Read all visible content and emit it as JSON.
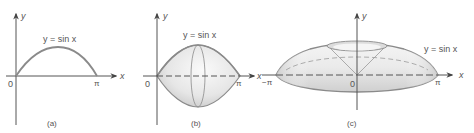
{
  "figure": {
    "panels": [
      {
        "id": "a",
        "caption": "(a)",
        "curve_label": "y = sin x",
        "axis_x_label": "x",
        "axis_y_label": "y",
        "origin_label": "0",
        "x_end_label": "π"
      },
      {
        "id": "b",
        "caption": "(b)",
        "curve_label": "y = sin x",
        "axis_x_label": "x",
        "axis_y_label": "y",
        "origin_label": "0",
        "x_end_label": "π"
      },
      {
        "id": "c",
        "caption": "(c)",
        "curve_label": "y = sin x",
        "axis_x_label": "x",
        "axis_y_label": "y",
        "origin_label": "0",
        "x_end_label": "π",
        "x_start_label": "−π"
      }
    ]
  },
  "colors": {
    "line": "#888888",
    "axis": "#555555",
    "fill_light": "#f2f2f2",
    "fill_dark": "#c8c8c8"
  }
}
